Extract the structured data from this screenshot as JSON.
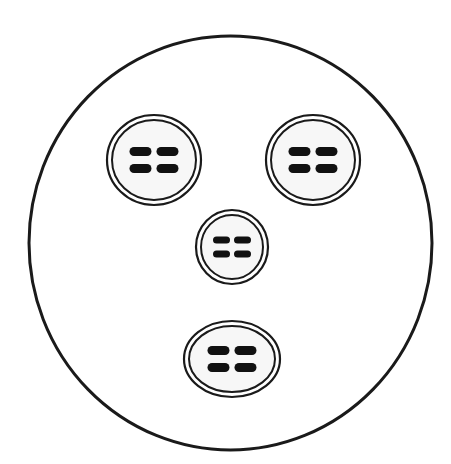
{
  "diagram": {
    "colors": {
      "stroke": "#1a1a1a",
      "fill": "#ffffff",
      "bars": "#111111"
    },
    "outer_circle": {
      "cx": 230.5,
      "cy": 243,
      "rx": 201.5,
      "ry": 207,
      "stroke_width": 3
    },
    "cells": [
      {
        "id": "top-left",
        "cx": 154,
        "cy": 160,
        "rx": 47,
        "ry": 45,
        "bar_w": 22,
        "bar_h": 9,
        "gap_x": 5,
        "gap_y": 17
      },
      {
        "id": "top-right",
        "cx": 313,
        "cy": 160,
        "rx": 47,
        "ry": 45,
        "bar_w": 22,
        "bar_h": 9,
        "gap_x": 5,
        "gap_y": 17
      },
      {
        "id": "middle",
        "cx": 232,
        "cy": 247,
        "rx": 36,
        "ry": 37,
        "bar_w": 17,
        "bar_h": 7,
        "gap_x": 4,
        "gap_y": 14
      },
      {
        "id": "bottom",
        "cx": 232,
        "cy": 359,
        "rx": 48,
        "ry": 38,
        "bar_w": 22,
        "bar_h": 9,
        "gap_x": 5,
        "gap_y": 17
      }
    ]
  }
}
